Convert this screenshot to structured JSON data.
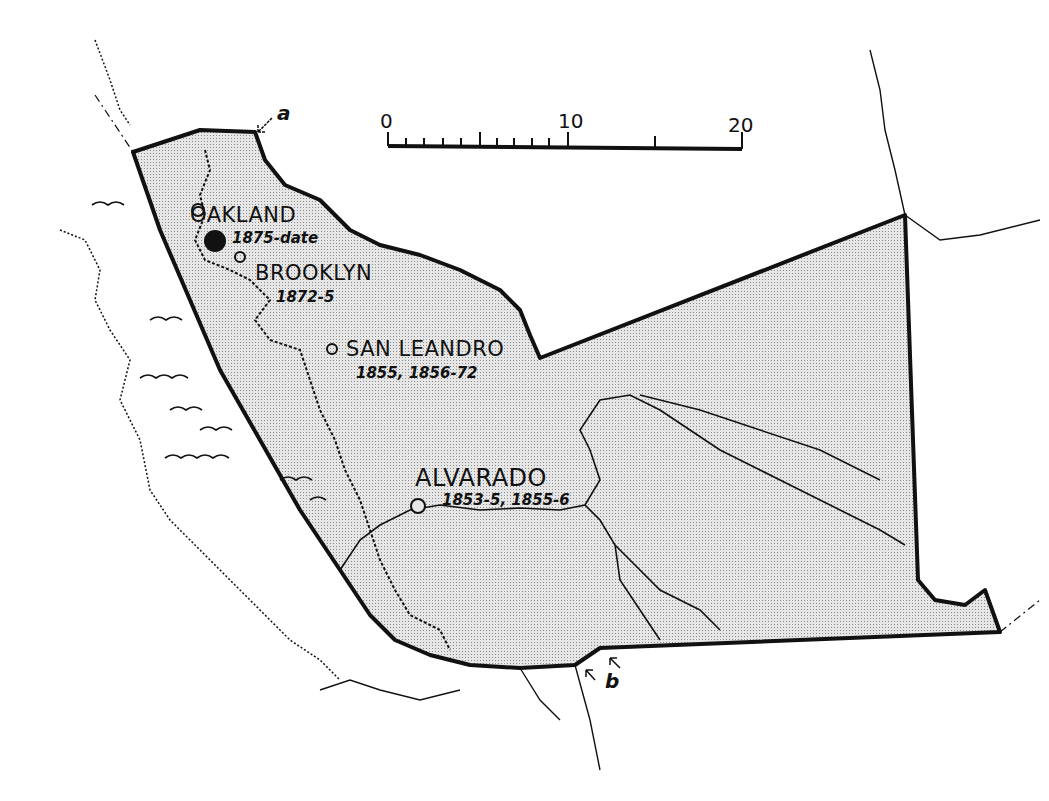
{
  "map": {
    "type": "historical county map",
    "scale_bar": {
      "ticks": [
        "0",
        "10",
        "20"
      ],
      "units_minor_divisions": 10
    },
    "places": [
      {
        "name": "OAKLAND",
        "dates": "1875-date",
        "symbol": "filled-circle"
      },
      {
        "name": "BROOKLYN",
        "dates": "1872-5",
        "symbol": "open-circle"
      },
      {
        "name": "SAN LEANDRO",
        "dates": "1855, 1856-72",
        "symbol": "open-circle"
      },
      {
        "name": "ALVARADO",
        "dates": "1853-5, 1855-6",
        "symbol": "open-circle"
      }
    ],
    "markers": [
      {
        "label": "a"
      },
      {
        "label": "b"
      }
    ],
    "colors": {
      "ink": "#111111",
      "shaded_area": "#d9d9d9",
      "background": "#ffffff"
    }
  }
}
